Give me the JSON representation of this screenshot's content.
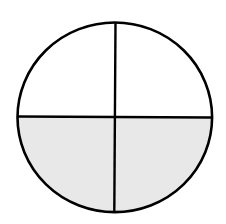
{
  "diagram": {
    "type": "fraction-circle",
    "total_parts": 4,
    "shaded_parts": 2,
    "fraction": "2/4",
    "shaded_regions": [
      "bottom-left",
      "bottom-right"
    ],
    "colors": {
      "stroke": "#000000",
      "shaded_fill": "#e8e8e8",
      "unshaded_fill": "#ffffff",
      "background": "#ffffff"
    }
  }
}
